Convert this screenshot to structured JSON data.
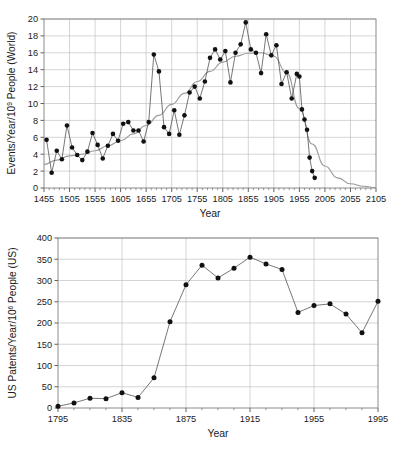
{
  "figure": {
    "panels": [
      "top",
      "bottom"
    ]
  },
  "chart_data": [
    {
      "id": "top",
      "type": "scatter",
      "title": "",
      "xlabel": "Year",
      "ylabel": "Events/Year/10⁹ People (World)",
      "ylabel_parts": {
        "pre": "Events/Year/10",
        "sup": "9",
        "post": " People (World)"
      },
      "xlim": [
        1455,
        2105
      ],
      "ylim": [
        0,
        20
      ],
      "xticks": [
        1455,
        1505,
        1555,
        1605,
        1655,
        1705,
        1755,
        1805,
        1855,
        1905,
        1955,
        2005,
        2055,
        2105
      ],
      "xtick_labels": [
        "1455",
        "1505",
        "1555",
        "1605",
        "1655",
        "1705",
        "1755",
        "1805",
        "1855",
        "1905",
        "1955",
        "2005",
        "2055",
        "2105"
      ],
      "yticks": [
        0,
        2,
        4,
        6,
        8,
        10,
        12,
        14,
        16,
        18,
        20
      ],
      "ytick_labels": [
        "0",
        "2",
        "4",
        "6",
        "8",
        "10",
        "12",
        "14",
        "16",
        "18",
        "20"
      ],
      "x_minor_step": 10,
      "grid": true,
      "legend": "none",
      "series": [
        {
          "name": "Events per year per billion people (World)",
          "marker": "filled-circle",
          "line": true,
          "x": [
            1460,
            1470,
            1480,
            1490,
            1500,
            1510,
            1520,
            1530,
            1540,
            1550,
            1560,
            1570,
            1580,
            1590,
            1600,
            1610,
            1620,
            1630,
            1640,
            1650,
            1660,
            1670,
            1680,
            1690,
            1700,
            1710,
            1720,
            1730,
            1740,
            1750,
            1760,
            1770,
            1780,
            1790,
            1800,
            1810,
            1820,
            1830,
            1840,
            1850,
            1860,
            1870,
            1880,
            1890,
            1900,
            1910,
            1920,
            1930,
            1940,
            1950,
            1955,
            1960,
            1965,
            1970,
            1975,
            1980,
            1985
          ],
          "y": [
            5.7,
            1.8,
            4.4,
            3.4,
            7.4,
            4.8,
            3.9,
            3.3,
            4.3,
            6.5,
            5.1,
            3.5,
            5.0,
            6.4,
            5.6,
            7.6,
            7.8,
            6.8,
            6.8,
            5.5,
            7.8,
            15.8,
            13.8,
            7.2,
            6.4,
            9.2,
            6.3,
            8.6,
            11.3,
            12.0,
            10.6,
            12.6,
            15.4,
            16.4,
            15.2,
            16.2,
            12.5,
            16.0,
            17.0,
            19.6,
            16.4,
            16.0,
            13.6,
            18.2,
            15.7,
            16.9,
            12.3,
            13.7,
            10.6,
            13.5,
            13.2,
            9.3,
            8.1,
            6.9,
            3.6,
            2.0,
            1.2
          ]
        }
      ],
      "trend": {
        "name": "fitted smooth curve",
        "x": [
          1455,
          1480,
          1505,
          1530,
          1555,
          1580,
          1605,
          1630,
          1655,
          1680,
          1705,
          1730,
          1755,
          1780,
          1805,
          1830,
          1855,
          1880,
          1905,
          1930,
          1955,
          1980,
          2005,
          2030,
          2055,
          2080,
          2105
        ],
        "y": [
          2.8,
          3.3,
          3.8,
          4.0,
          4.4,
          5.0,
          5.6,
          6.4,
          7.4,
          8.6,
          9.9,
          11.2,
          12.6,
          13.8,
          14.9,
          15.6,
          15.95,
          16.0,
          15.6,
          13.6,
          9.4,
          5.2,
          2.6,
          1.2,
          0.5,
          0.2,
          0.05
        ]
      }
    },
    {
      "id": "bottom",
      "type": "scatter",
      "title": "",
      "xlabel": "Year",
      "ylabel": "US Patents/Year/10⁶ People (US)",
      "ylabel_parts": {
        "pre": "US Patents/Year/10",
        "sup": "6",
        "post": " People (US)"
      },
      "xlim": [
        1795,
        1995
      ],
      "ylim": [
        0,
        400
      ],
      "xticks": [
        1795,
        1835,
        1875,
        1915,
        1955,
        1995
      ],
      "xtick_labels": [
        "1795",
        "1835",
        "1875",
        "1915",
        "1955",
        "1995"
      ],
      "yticks": [
        0,
        50,
        100,
        150,
        200,
        250,
        300,
        350,
        400
      ],
      "ytick_labels": [
        "0",
        "50",
        "100",
        "150",
        "200",
        "250",
        "300",
        "350",
        "400"
      ],
      "x_minor_step": 10,
      "grid": true,
      "legend": "none",
      "series": [
        {
          "name": "US patents per year per million people (US)",
          "marker": "filled-circle",
          "line": true,
          "x": [
            1795,
            1805,
            1815,
            1825,
            1835,
            1845,
            1855,
            1865,
            1875,
            1885,
            1895,
            1905,
            1915,
            1925,
            1935,
            1945,
            1955,
            1965,
            1975,
            1985,
            1995
          ],
          "y": [
            4,
            12,
            23,
            22,
            36,
            25,
            71,
            203,
            290,
            336,
            306,
            329,
            355,
            339,
            326,
            225,
            241,
            245,
            221,
            177,
            251
          ]
        }
      ]
    }
  ]
}
